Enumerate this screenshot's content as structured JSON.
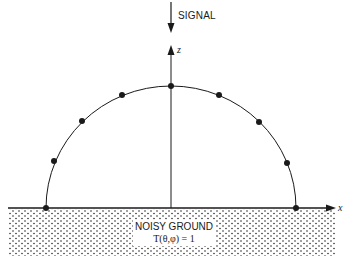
{
  "diagram": {
    "signal_label": "SIGNAL",
    "z_axis_label": "z",
    "x_axis_label": "x",
    "ground": {
      "title": "NOISY GROUND",
      "formula": "T(θ,φ) = 1"
    },
    "colors": {
      "line": "#1a1a1a",
      "background": "#ffffff",
      "stipple": "#2a2a2a"
    },
    "geometry": {
      "center": [
        171,
        208
      ],
      "radius_x": 125,
      "radius_y": 122,
      "dot_count": 9
    }
  }
}
